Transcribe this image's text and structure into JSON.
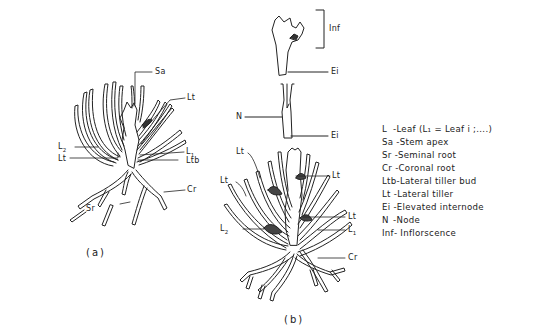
{
  "figure": {
    "panel_a": {
      "caption": "(a)",
      "labels": {
        "sa": "Sa",
        "lt_top": "Lt",
        "l2": "L2",
        "lt_left": "Lt",
        "l1": "L1",
        "ltb": "Ltb",
        "cr": "Cr",
        "sr": "Sr"
      }
    },
    "panel_b": {
      "caption": "(b)",
      "labels": {
        "inf": "Inf",
        "ei_top": "Ei",
        "n": "N",
        "ei_bottom": "Ei",
        "lt_top_left": "Lt",
        "lt_mid_right": "Lt",
        "lt_left": "Lt",
        "lt_right": "Lt",
        "l2": "L2",
        "l1": "L1",
        "cr": "Cr"
      }
    },
    "legend": [
      {
        "abbr": "L",
        "text": " -Leaf (L₁ = Leaf i ;....)"
      },
      {
        "abbr": "Sa",
        "text": " -Stem apex"
      },
      {
        "abbr": "Sr",
        "text": " -Seminal root"
      },
      {
        "abbr": "Cr",
        "text": " -Coronal root"
      },
      {
        "abbr": "Ltb",
        "text": "-Lateral tiller bud"
      },
      {
        "abbr": "Lt",
        "text": " -Lateral tiller"
      },
      {
        "abbr": "Ei",
        "text": " -Elevated internode"
      },
      {
        "abbr": "N",
        "text": "  -Node"
      },
      {
        "abbr": "Inf",
        "text": "- Inflorscence"
      }
    ]
  }
}
